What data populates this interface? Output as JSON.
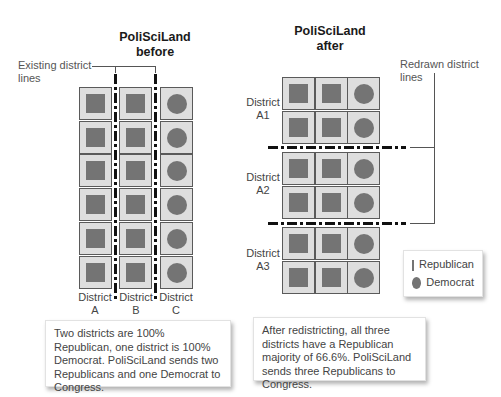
{
  "before": {
    "title_line1": "PoliSciLand",
    "title_line2": "before",
    "annotation_line1": "Existing district",
    "annotation_line2": "lines",
    "districts": [
      {
        "label_line1": "District",
        "label_line2": "A",
        "voters": [
          "republican",
          "republican",
          "republican",
          "republican",
          "republican",
          "republican"
        ]
      },
      {
        "label_line1": "District",
        "label_line2": "B",
        "voters": [
          "republican",
          "republican",
          "republican",
          "republican",
          "republican",
          "republican"
        ]
      },
      {
        "label_line1": "District",
        "label_line2": "C",
        "voters": [
          "democrat",
          "democrat",
          "democrat",
          "democrat",
          "democrat",
          "democrat"
        ]
      }
    ],
    "caption": "Two districts are 100% Republican, one district is 100% Democrat. PoliSciLand sends two Republicans and one Democrat to Congress."
  },
  "after": {
    "title_line1": "PoliSciLand",
    "title_line2": "after",
    "annotation_line1": "Redrawn district",
    "annotation_line2": "lines",
    "districts": [
      {
        "label_line1": "District",
        "label_line2": "A1",
        "rows": [
          [
            "republican",
            "republican",
            "democrat"
          ],
          [
            "republican",
            "republican",
            "democrat"
          ]
        ]
      },
      {
        "label_line1": "District",
        "label_line2": "A2",
        "rows": [
          [
            "republican",
            "republican",
            "democrat"
          ],
          [
            "republican",
            "republican",
            "democrat"
          ]
        ]
      },
      {
        "label_line1": "District",
        "label_line2": "A3",
        "rows": [
          [
            "republican",
            "republican",
            "democrat"
          ],
          [
            "republican",
            "republican",
            "democrat"
          ]
        ]
      }
    ],
    "caption": "After redistricting, all three districts have a Republican majority of 66.6%. PoliSciLand sends three Republicans to Congress."
  },
  "legend": {
    "republican": {
      "label": "Republican",
      "shape": "square"
    },
    "democrat": {
      "label": "Democrat",
      "shape": "circle"
    }
  },
  "colors": {
    "marker": "#747474",
    "cell_bg": "#dedede",
    "cell_border": "#5a5a5a",
    "district_line": "#111111"
  }
}
